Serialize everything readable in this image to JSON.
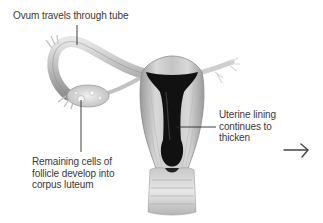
{
  "diagram": {
    "type": "anatomical illustration",
    "labels": {
      "ovum": "Ovum travels through tube",
      "uterine": "Uterine lining\ncontinues to\nthicken",
      "remaining": "Remaining cells of\nfollicle develop into\ncorpus luteum"
    },
    "icons": {
      "next_arrow": "right-arrow"
    },
    "colors": {
      "background": "#ffffff",
      "text": "#3a3a3a",
      "leader_line": "#2a2a2a",
      "tissue_light": "#d6d6d6",
      "tissue_mid": "#a8a8a8",
      "cavity_dark": "#111111"
    }
  }
}
